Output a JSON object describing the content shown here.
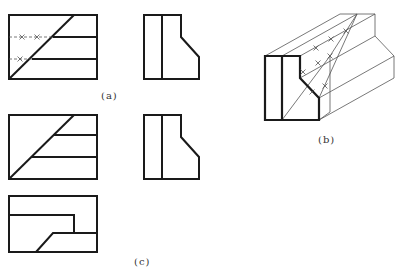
{
  "colors": {
    "background": "#ffffff",
    "thick": "#1a1a1a",
    "thin": "#555555",
    "label": "#333333"
  },
  "labels": [
    {
      "id": "a",
      "text": "(a)",
      "x": 101,
      "y": 90
    },
    {
      "id": "b",
      "text": "(b)",
      "x": 318,
      "y": 134
    },
    {
      "id": "c",
      "text": "(c)",
      "x": 134,
      "y": 256
    }
  ],
  "figures": {
    "a_front": {
      "rect": [
        9,
        15,
        88,
        64
      ],
      "thick_lines": [
        [
          9,
          79,
          74,
          15
        ],
        [
          53,
          37,
          97,
          37
        ],
        [
          32,
          59,
          97,
          59
        ]
      ],
      "thin_lines": [
        [
          9,
          37,
          53,
          37
        ],
        [
          9,
          59,
          32,
          59
        ]
      ],
      "crosses": [
        [
          22,
          37
        ],
        [
          37,
          37
        ],
        [
          20,
          59
        ]
      ]
    },
    "a_side": {
      "outline": [
        [
          144,
          15
        ],
        [
          181,
          15
        ],
        [
          181,
          37
        ],
        [
          199,
          57
        ],
        [
          199,
          79
        ],
        [
          144,
          79
        ]
      ],
      "thick_lines": [
        [
          162,
          15,
          162,
          79
        ]
      ]
    },
    "b_iso": {
      "front": [
        [
          265,
          56
        ],
        [
          300,
          56
        ],
        [
          300,
          78
        ],
        [
          319,
          98
        ],
        [
          319,
          120
        ],
        [
          265,
          120
        ]
      ],
      "thick_lines": [
        [
          282,
          56,
          282,
          120
        ]
      ],
      "thin_lines": [
        [
          265,
          56,
          340,
          14
        ],
        [
          300,
          56,
          375,
          14
        ],
        [
          340,
          14,
          375,
          14
        ],
        [
          375,
          14,
          375,
          36
        ],
        [
          375,
          36,
          394,
          56
        ],
        [
          394,
          56,
          394,
          78
        ],
        [
          319,
          120,
          394,
          78
        ],
        [
          319,
          98,
          394,
          56
        ],
        [
          300,
          78,
          375,
          36
        ],
        [
          282,
          56,
          357,
          14
        ],
        [
          357,
          14,
          319,
          98
        ],
        [
          357,
          14,
          330,
          56
        ],
        [
          330,
          56,
          330,
          112
        ],
        [
          282,
          120,
          330,
          56
        ],
        [
          330,
          112,
          319,
          120
        ]
      ],
      "crosses": [
        [
          316,
          48
        ],
        [
          331,
          39
        ],
        [
          346,
          31
        ],
        [
          303,
          72
        ],
        [
          318,
          63
        ],
        [
          330,
          56
        ],
        [
          312,
          92
        ],
        [
          325,
          86
        ]
      ]
    },
    "c_front": {
      "rect": [
        9,
        115,
        88,
        64
      ],
      "thick_lines": [
        [
          9,
          179,
          74,
          115
        ],
        [
          53,
          135,
          97,
          135
        ],
        [
          32,
          157,
          97,
          157
        ]
      ]
    },
    "c_side": {
      "outline": [
        [
          144,
          115
        ],
        [
          181,
          115
        ],
        [
          181,
          137
        ],
        [
          199,
          157
        ],
        [
          199,
          179
        ],
        [
          144,
          179
        ]
      ],
      "thick_lines": [
        [
          162,
          115,
          162,
          179
        ]
      ]
    },
    "c_top": {
      "rect": [
        9,
        196,
        88,
        56
      ],
      "thick_polylines": [
        [
          [
            9,
            215
          ],
          [
            74,
            215
          ],
          [
            74,
            233
          ]
        ],
        [
          [
            36,
            252
          ],
          [
            53,
            233
          ],
          [
            97,
            233
          ]
        ]
      ]
    }
  }
}
